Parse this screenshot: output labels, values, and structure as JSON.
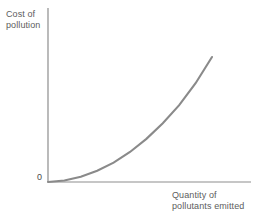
{
  "figure": {
    "name": "cost-of-pollution-curve",
    "background_color": "#ffffff",
    "axis_color": "#8d8d8d",
    "curve_color": "#8a8a8a",
    "text_color": "#5d5d5d"
  },
  "labels": {
    "ylabel_line1": "Cost of",
    "ylabel_line2": "pollution",
    "xlabel_line1": "Quantity of",
    "xlabel_line2": "pollutants emitted",
    "origin": "0"
  },
  "chart_data": {
    "type": "line",
    "title": "",
    "subtitle": "",
    "xlabel": "Quantity of pollutants emitted",
    "ylabel": "Cost of pollution",
    "grid": false,
    "legend": false,
    "legend_position": "none",
    "xlim": [
      0,
      1
    ],
    "ylim": [
      0,
      1
    ],
    "xticks": [
      0
    ],
    "yticks": [
      0
    ],
    "xticklabels": [
      "0"
    ],
    "yticklabels": [
      "0"
    ],
    "annotations": [
      "0"
    ],
    "series": [
      {
        "name": "Cost of pollution",
        "color": "#8a8a8a",
        "x": [
          0.0,
          0.1,
          0.2,
          0.3,
          0.4,
          0.5,
          0.6,
          0.7,
          0.8,
          0.9,
          1.0
        ],
        "y": [
          0.0,
          0.012,
          0.042,
          0.09,
          0.155,
          0.24,
          0.345,
          0.47,
          0.615,
          0.79,
          1.0
        ],
        "shape": "convex-increasing"
      }
    ]
  }
}
